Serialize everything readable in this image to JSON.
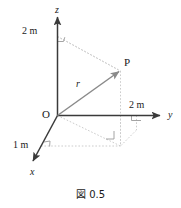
{
  "figure": {
    "caption": "図 0.5",
    "colors": {
      "axis": "#3a3a3a",
      "vector": "#777777",
      "dotted": "#c8c8c8",
      "text": "#1a1a1a"
    },
    "axes": [
      {
        "id": "z",
        "label": "z",
        "direction": "up"
      },
      {
        "id": "y",
        "label": "y",
        "direction": "right"
      },
      {
        "id": "x",
        "label": "x",
        "direction": "down-left"
      }
    ],
    "origin_label": "O",
    "point_label": "P",
    "vector_label": "r",
    "dimensions": [
      {
        "axis": "z",
        "value": "2 m"
      },
      {
        "axis": "y",
        "value": "2 m"
      },
      {
        "axis": "x",
        "value": "1 m"
      }
    ],
    "right_angle_markers": 4
  }
}
